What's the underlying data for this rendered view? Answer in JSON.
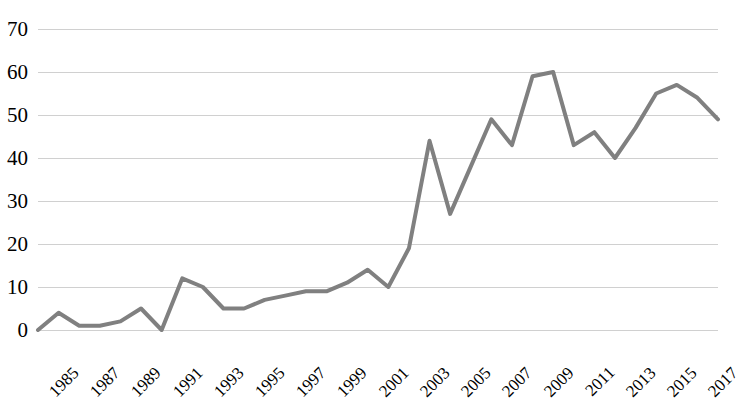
{
  "chart_data": {
    "type": "line",
    "title": "",
    "subtitle": "",
    "xlabel": "",
    "ylabel": "",
    "ylim": [
      0,
      70
    ],
    "ytick_labels": [
      "70",
      "60",
      "50",
      "40",
      "30",
      "20",
      "10",
      "0"
    ],
    "ytick_values": [
      70,
      60,
      50,
      40,
      30,
      20,
      10,
      0
    ],
    "grid": true,
    "grid_axis": "y",
    "legend": false,
    "legend_position": "none",
    "line_color": "#808080",
    "line_width": 4,
    "x": [
      1985,
      1986,
      1987,
      1988,
      1989,
      1990,
      1991,
      1992,
      1993,
      1994,
      1995,
      1996,
      1997,
      1998,
      1999,
      2000,
      2001,
      2002,
      2003,
      2004,
      2005,
      2006,
      2007,
      2008,
      2009,
      2010,
      2011,
      2012,
      2013,
      2014,
      2015,
      2016,
      2017,
      2018
    ],
    "xtick_labels": [
      "1985",
      "1987",
      "1989",
      "1991",
      "1993",
      "1995",
      "1997",
      "1999",
      "2001",
      "2003",
      "2005",
      "2007",
      "2009",
      "2011",
      "2013",
      "2015",
      "2017"
    ],
    "xtick_values": [
      1985,
      1987,
      1989,
      1991,
      1993,
      1995,
      1997,
      1999,
      2001,
      2003,
      2005,
      2007,
      2009,
      2011,
      2013,
      2015,
      2017
    ],
    "xtick_rotation": -45,
    "values": [
      0,
      4,
      1,
      1,
      2,
      5,
      0,
      12,
      10,
      5,
      5,
      7,
      8,
      9,
      9,
      11,
      14,
      10,
      19,
      44,
      27,
      38,
      49,
      43,
      59,
      60,
      43,
      46,
      40,
      47,
      55,
      57,
      54,
      49
    ],
    "series": [
      {
        "name": "series-1",
        "color": "#808080",
        "values": [
          0,
          4,
          1,
          1,
          2,
          5,
          0,
          12,
          10,
          5,
          5,
          7,
          8,
          9,
          9,
          11,
          14,
          10,
          19,
          44,
          27,
          38,
          49,
          43,
          59,
          60,
          43,
          46,
          40,
          47,
          55,
          57,
          54,
          49
        ]
      }
    ]
  }
}
